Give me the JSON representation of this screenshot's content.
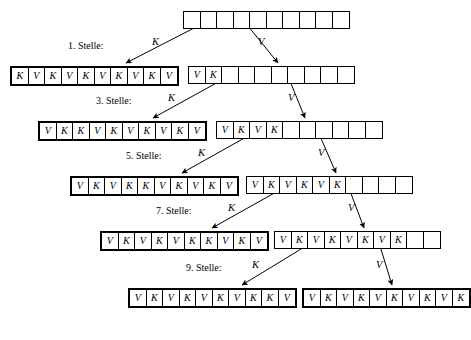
{
  "diagram": {
    "cell_symbols": {
      "key": "K",
      "value": "V",
      "empty": ""
    },
    "edge_labels": {
      "left": "K",
      "right": "V"
    },
    "root": {
      "name": "root-array",
      "cells": [
        "",
        "",
        "",
        "",
        "",
        "",
        "",
        "",
        "",
        ""
      ],
      "bold": false,
      "x": 183,
      "y": 11,
      "width": 165
    },
    "levels": [
      {
        "step_label": "1. Stelle:",
        "step_x": 68,
        "step_y": 40,
        "left_edge_label": "K",
        "left_edge_label_x": 152,
        "left_edge_label_y": 36,
        "right_edge_label": "V",
        "right_edge_label_x": 258,
        "right_edge_label_y": 36,
        "left": {
          "name": "level-1-left-array",
          "cells": [
            "K",
            "V",
            "K",
            "V",
            "K",
            "V",
            "K",
            "V",
            "K",
            "V"
          ],
          "bold": true,
          "x": 10,
          "y": 66
        },
        "right": {
          "name": "level-1-right-array",
          "cells": [
            "V",
            "K",
            "",
            "",
            "",
            "",
            "",
            "",
            "",
            ""
          ],
          "bold": false,
          "x": 188,
          "y": 66
        }
      },
      {
        "step_label": "3. Stelle:",
        "step_x": 96,
        "step_y": 95,
        "left_edge_label": "K",
        "left_edge_label_x": 168,
        "left_edge_label_y": 92,
        "right_edge_label": "V",
        "right_edge_label_x": 288,
        "right_edge_label_y": 92,
        "left": {
          "name": "level-2-left-array",
          "cells": [
            "V",
            "K",
            "K",
            "V",
            "K",
            "V",
            "K",
            "V",
            "K",
            "V"
          ],
          "bold": true,
          "x": 38,
          "y": 121
        },
        "right": {
          "name": "level-2-right-array",
          "cells": [
            "V",
            "K",
            "V",
            "K",
            "",
            "",
            "",
            "",
            "",
            ""
          ],
          "bold": false,
          "x": 216,
          "y": 121
        }
      },
      {
        "step_label": "5. Stelle:",
        "step_x": 126,
        "step_y": 150,
        "left_edge_label": "K",
        "left_edge_label_x": 198,
        "left_edge_label_y": 147,
        "right_edge_label": "V",
        "right_edge_label_x": 318,
        "right_edge_label_y": 147,
        "left": {
          "name": "level-3-left-array",
          "cells": [
            "V",
            "K",
            "V",
            "K",
            "K",
            "V",
            "K",
            "V",
            "K",
            "V"
          ],
          "bold": true,
          "x": 70,
          "y": 176
        },
        "right": {
          "name": "level-3-right-array",
          "cells": [
            "V",
            "K",
            "V",
            "K",
            "V",
            "K",
            "",
            "",
            "",
            ""
          ],
          "bold": false,
          "x": 246,
          "y": 176
        }
      },
      {
        "step_label": "7. Stelle:",
        "step_x": 156,
        "step_y": 205,
        "left_edge_label": "K",
        "left_edge_label_x": 228,
        "left_edge_label_y": 202,
        "right_edge_label": "V",
        "right_edge_label_x": 348,
        "right_edge_label_y": 202,
        "left": {
          "name": "level-4-left-array",
          "cells": [
            "V",
            "K",
            "V",
            "K",
            "V",
            "K",
            "K",
            "V",
            "K",
            "V"
          ],
          "bold": true,
          "x": 100,
          "y": 231
        },
        "right": {
          "name": "level-4-right-array",
          "cells": [
            "V",
            "K",
            "V",
            "K",
            "V",
            "K",
            "V",
            "K",
            "",
            ""
          ],
          "bold": false,
          "x": 274,
          "y": 231
        }
      },
      {
        "step_label": "9. Stelle:",
        "step_x": 186,
        "step_y": 262,
        "left_edge_label": "K",
        "left_edge_label_x": 252,
        "left_edge_label_y": 259,
        "right_edge_label": "V",
        "right_edge_label_x": 376,
        "right_edge_label_y": 259,
        "left": {
          "name": "level-5-left-array",
          "cells": [
            "V",
            "K",
            "V",
            "K",
            "V",
            "K",
            "V",
            "K",
            "K",
            "V"
          ],
          "bold": true,
          "x": 128,
          "y": 288
        },
        "right": {
          "name": "level-5-right-array",
          "cells": [
            "V",
            "K",
            "V",
            "K",
            "V",
            "K",
            "V",
            "K",
            "V",
            "K"
          ],
          "bold": true,
          "x": 302,
          "y": 288
        }
      }
    ],
    "arrows": [
      {
        "name": "arrow-level-1-left",
        "x1": 198,
        "y1": 26,
        "x2": 126,
        "y2": 63
      },
      {
        "name": "arrow-level-1-right",
        "x1": 248,
        "y1": 26,
        "x2": 278,
        "y2": 63
      },
      {
        "name": "arrow-level-2-left",
        "x1": 220,
        "y1": 81,
        "x2": 153,
        "y2": 118
      },
      {
        "name": "arrow-level-2-right",
        "x1": 290,
        "y1": 81,
        "x2": 305,
        "y2": 118
      },
      {
        "name": "arrow-level-3-left",
        "x1": 248,
        "y1": 136,
        "x2": 182,
        "y2": 173
      },
      {
        "name": "arrow-level-3-right",
        "x1": 320,
        "y1": 136,
        "x2": 336,
        "y2": 173
      },
      {
        "name": "arrow-level-4-left",
        "x1": 278,
        "y1": 191,
        "x2": 212,
        "y2": 228
      },
      {
        "name": "arrow-level-4-right",
        "x1": 350,
        "y1": 191,
        "x2": 364,
        "y2": 228
      },
      {
        "name": "arrow-level-5-left",
        "x1": 306,
        "y1": 246,
        "x2": 242,
        "y2": 285
      },
      {
        "name": "arrow-level-5-right",
        "x1": 380,
        "y1": 246,
        "x2": 392,
        "y2": 285
      }
    ]
  }
}
